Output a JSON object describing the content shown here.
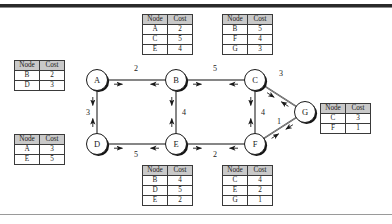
{
  "figure": {
    "type": "network-routing-diagram"
  },
  "colors": {
    "node_fill": "#ffffff",
    "node_stroke": "#1a1a1a",
    "node_shadow": "#141414",
    "edge": "#3a3a3a",
    "table_header_bg": "#c9c9c9",
    "table_border": "#3a3a3a",
    "rule": "#2a2a2a"
  },
  "table_headers": {
    "node": "Node",
    "cost": "Cost"
  },
  "nodes": [
    {
      "id": "A",
      "label": "A",
      "cx": 97,
      "cy": 80
    },
    {
      "id": "B",
      "label": "B",
      "cx": 176,
      "cy": 80
    },
    {
      "id": "C",
      "label": "C",
      "cx": 255,
      "cy": 80
    },
    {
      "id": "D",
      "label": "D",
      "cx": 97,
      "cy": 144
    },
    {
      "id": "E",
      "label": "E",
      "cx": 176,
      "cy": 144
    },
    {
      "id": "F",
      "label": "F",
      "cx": 255,
      "cy": 144
    },
    {
      "id": "G",
      "label": "G",
      "cx": 305,
      "cy": 112
    }
  ],
  "edges": [
    {
      "from": "A",
      "to": "B",
      "weight": "2",
      "label_x": 136,
      "label_y": 71
    },
    {
      "from": "B",
      "to": "C",
      "weight": "5",
      "label_x": 215,
      "label_y": 71
    },
    {
      "from": "A",
      "to": "D",
      "weight": "3",
      "label_x": 88,
      "label_y": 115
    },
    {
      "from": "B",
      "to": "E",
      "weight": "4",
      "label_x": 184,
      "label_y": 115
    },
    {
      "from": "C",
      "to": "F",
      "weight": "4",
      "label_x": 263,
      "label_y": 115
    },
    {
      "from": "D",
      "to": "E",
      "weight": "5",
      "label_x": 136,
      "label_y": 157
    },
    {
      "from": "E",
      "to": "F",
      "weight": "2",
      "label_x": 215,
      "label_y": 157
    },
    {
      "from": "C",
      "to": "G",
      "weight": "3",
      "label_x": 281,
      "label_y": 76
    },
    {
      "from": "F",
      "to": "G",
      "weight": "1",
      "label_x": 279,
      "label_y": 124
    }
  ],
  "tables": [
    {
      "owner": "A",
      "name": "cost-table-a",
      "position": {
        "left": 14,
        "top": 60
      },
      "rows": [
        {
          "node": "B",
          "cost": "2"
        },
        {
          "node": "D",
          "cost": "3"
        }
      ]
    },
    {
      "owner": "D",
      "name": "cost-table-d",
      "position": {
        "left": 14,
        "top": 134
      },
      "rows": [
        {
          "node": "A",
          "cost": "3"
        },
        {
          "node": "E",
          "cost": "5"
        }
      ]
    },
    {
      "owner": "B",
      "name": "cost-table-b",
      "position": {
        "left": 142,
        "top": 14
      },
      "rows": [
        {
          "node": "A",
          "cost": "2"
        },
        {
          "node": "C",
          "cost": "5"
        },
        {
          "node": "E",
          "cost": "4"
        }
      ]
    },
    {
      "owner": "C",
      "name": "cost-table-c",
      "position": {
        "left": 222,
        "top": 14
      },
      "rows": [
        {
          "node": "B",
          "cost": "5"
        },
        {
          "node": "F",
          "cost": "4"
        },
        {
          "node": "G",
          "cost": "3"
        }
      ]
    },
    {
      "owner": "G",
      "name": "cost-table-g",
      "position": {
        "left": 320,
        "top": 103
      },
      "rows": [
        {
          "node": "C",
          "cost": "3"
        },
        {
          "node": "F",
          "cost": "1"
        }
      ]
    },
    {
      "owner": "E",
      "name": "cost-table-e",
      "position": {
        "left": 142,
        "top": 165
      },
      "rows": [
        {
          "node": "B",
          "cost": "4"
        },
        {
          "node": "D",
          "cost": "5"
        },
        {
          "node": "E",
          "cost": "2"
        }
      ]
    },
    {
      "owner": "F",
      "name": "cost-table-f",
      "position": {
        "left": 222,
        "top": 165
      },
      "rows": [
        {
          "node": "C",
          "cost": "4"
        },
        {
          "node": "E",
          "cost": "2"
        },
        {
          "node": "G",
          "cost": "1"
        }
      ]
    }
  ]
}
